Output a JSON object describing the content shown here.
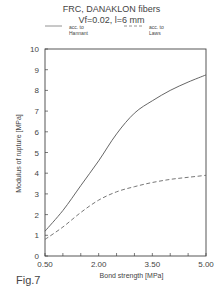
{
  "figure": {
    "title_line1": "FRC, DANAKLON fibers",
    "title_line2": "Vf=0.02, l=6 mm",
    "caption": "Fig.7"
  },
  "legend": {
    "hannant_line1": "acc. to",
    "hannant_line2": "Hannant",
    "laws_line1": "acc. to",
    "laws_line2": "Laws"
  },
  "axes": {
    "xlabel": "Bond strength  [MPa]",
    "ylabel": "Modulus of rupture  [MPa]",
    "x_tick_labels": [
      "0.50",
      "2.00",
      "3.50",
      "5.00"
    ],
    "y_tick_labels": [
      "0",
      "1",
      "2",
      "3",
      "4",
      "5",
      "6",
      "7",
      "8",
      "9",
      "10"
    ]
  },
  "chart_data": {
    "type": "line",
    "xlabel": "Bond strength [MPa]",
    "ylabel": "Modulus of rupture [MPa]",
    "xlim": [
      0.5,
      5.0
    ],
    "ylim": [
      0,
      10
    ],
    "x_ticks": [
      0.5,
      1.0,
      1.5,
      2.0,
      2.5,
      3.0,
      3.5,
      4.0,
      4.5,
      5.0
    ],
    "x_tick_labels": [
      "0.50",
      "2.00",
      "3.50",
      "5.00"
    ],
    "y_ticks": [
      0,
      1,
      2,
      3,
      4,
      5,
      6,
      7,
      8,
      9,
      10
    ],
    "grid": false,
    "legend_position": "top",
    "x": [
      0.5,
      1.0,
      1.5,
      2.0,
      2.5,
      3.0,
      3.5,
      4.0,
      4.5,
      5.0
    ],
    "series": [
      {
        "name": "acc. to Hannant",
        "style": "solid",
        "values": [
          1.2,
          2.2,
          3.4,
          4.6,
          5.9,
          6.9,
          7.5,
          8.0,
          8.4,
          8.75
        ]
      },
      {
        "name": "acc. to Laws",
        "style": "dashed",
        "values": [
          0.8,
          1.4,
          2.1,
          2.7,
          3.1,
          3.35,
          3.55,
          3.7,
          3.8,
          3.9
        ]
      }
    ],
    "annotations": [
      "Fig.7"
    ]
  },
  "colors": {
    "line": "#555555",
    "axis": "#444444"
  }
}
